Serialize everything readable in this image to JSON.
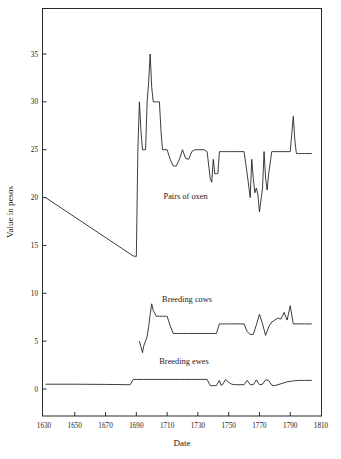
{
  "chart_data": {
    "type": "line",
    "title": "",
    "xlabel": "Date",
    "ylabel": "Value in pesos",
    "xlim": [
      1630,
      1810
    ],
    "ylim": [
      -2.8,
      39
    ],
    "grid": false,
    "legend_position": "inline-annotations",
    "x_ticks": [
      1630,
      1650,
      1670,
      1690,
      1710,
      1730,
      1750,
      1770,
      1790,
      1810
    ],
    "x_tick_labels": [
      "1630",
      "1650",
      "1670",
      "1690",
      "1710",
      "1730",
      "1750",
      "1770",
      "1790",
      "1810"
    ],
    "y_ticks": [
      0,
      5,
      10,
      15,
      20,
      25,
      30,
      35
    ],
    "y_tick_labels": [
      "0",
      "5",
      "10",
      "15",
      "20",
      "25",
      "30",
      "35"
    ],
    "annotations": [
      {
        "text": "Pairs of oxen",
        "x": 1722,
        "y": 19.8
      },
      {
        "text": "Breeding cows",
        "x": 1723,
        "y": 9.1
      },
      {
        "text": "Breeding ewes",
        "x": 1721,
        "y": 2.6
      }
    ],
    "series": [
      {
        "name": "Pairs of oxen",
        "color": "#1a1a1a",
        "points": [
          [
            1631,
            20.0
          ],
          [
            1688,
            13.9
          ],
          [
            1690,
            13.85
          ],
          [
            1691,
            25.0
          ],
          [
            1692,
            30.0
          ],
          [
            1693,
            27.0
          ],
          [
            1694,
            25.0
          ],
          [
            1695,
            25.0
          ],
          [
            1696,
            25.0
          ],
          [
            1697,
            30.0
          ],
          [
            1698,
            32.0
          ],
          [
            1699,
            35.0
          ],
          [
            1700,
            31.5
          ],
          [
            1701,
            30.0
          ],
          [
            1702,
            30.0
          ],
          [
            1703,
            30.0
          ],
          [
            1704,
            30.0
          ],
          [
            1705,
            30.0
          ],
          [
            1706,
            27.0
          ],
          [
            1707,
            25.0
          ],
          [
            1708,
            25.0
          ],
          [
            1710,
            25.0
          ],
          [
            1712,
            24.0
          ],
          [
            1714,
            23.3
          ],
          [
            1716,
            23.3
          ],
          [
            1718,
            24.0
          ],
          [
            1720,
            25.0
          ],
          [
            1722,
            24.1
          ],
          [
            1724,
            24.0
          ],
          [
            1726,
            24.8
          ],
          [
            1728,
            25.0
          ],
          [
            1730,
            25.0
          ],
          [
            1732,
            25.0
          ],
          [
            1734,
            25.0
          ],
          [
            1736,
            24.8
          ],
          [
            1738,
            22.0
          ],
          [
            1739,
            21.6
          ],
          [
            1740,
            24.0
          ],
          [
            1741,
            22.5
          ],
          [
            1742,
            22.5
          ],
          [
            1743,
            22.5
          ],
          [
            1744,
            24.8
          ],
          [
            1745,
            24.8
          ],
          [
            1746,
            24.8
          ],
          [
            1748,
            24.8
          ],
          [
            1750,
            24.8
          ],
          [
            1752,
            24.8
          ],
          [
            1754,
            24.8
          ],
          [
            1756,
            24.8
          ],
          [
            1758,
            24.8
          ],
          [
            1760,
            24.8
          ],
          [
            1762,
            22.5
          ],
          [
            1764,
            20.0
          ],
          [
            1765,
            24.0
          ],
          [
            1766,
            22.0
          ],
          [
            1767,
            20.5
          ],
          [
            1768,
            21.0
          ],
          [
            1769,
            20.3
          ],
          [
            1770,
            18.5
          ],
          [
            1772,
            21.0
          ],
          [
            1773,
            24.8
          ],
          [
            1774,
            22.0
          ],
          [
            1775,
            20.8
          ],
          [
            1776,
            22.5
          ],
          [
            1778,
            24.8
          ],
          [
            1780,
            24.8
          ],
          [
            1782,
            24.8
          ],
          [
            1784,
            24.8
          ],
          [
            1786,
            24.8
          ],
          [
            1788,
            24.8
          ],
          [
            1790,
            24.8
          ],
          [
            1792,
            28.5
          ],
          [
            1793,
            26.0
          ],
          [
            1794,
            24.6
          ],
          [
            1796,
            24.6
          ],
          [
            1798,
            24.6
          ],
          [
            1800,
            24.6
          ],
          [
            1804,
            24.6
          ]
        ]
      },
      {
        "name": "Breeding cows",
        "color": "#1a1a1a",
        "points": [
          [
            1692,
            5.0
          ],
          [
            1694,
            3.8
          ],
          [
            1695,
            4.6
          ],
          [
            1696,
            5.0
          ],
          [
            1697,
            5.5
          ],
          [
            1698,
            6.5
          ],
          [
            1699,
            7.8
          ],
          [
            1700,
            8.9
          ],
          [
            1701,
            8.2
          ],
          [
            1702,
            7.9
          ],
          [
            1703,
            7.6
          ],
          [
            1704,
            7.6
          ],
          [
            1705,
            7.6
          ],
          [
            1707,
            7.6
          ],
          [
            1709,
            7.6
          ],
          [
            1710,
            7.6
          ],
          [
            1712,
            6.6
          ],
          [
            1714,
            5.8
          ],
          [
            1716,
            5.8
          ],
          [
            1718,
            5.8
          ],
          [
            1720,
            5.8
          ],
          [
            1724,
            5.8
          ],
          [
            1728,
            5.8
          ],
          [
            1732,
            5.8
          ],
          [
            1736,
            5.8
          ],
          [
            1740,
            5.8
          ],
          [
            1742,
            5.8
          ],
          [
            1744,
            6.8
          ],
          [
            1746,
            6.8
          ],
          [
            1748,
            6.8
          ],
          [
            1752,
            6.8
          ],
          [
            1756,
            6.8
          ],
          [
            1758,
            6.8
          ],
          [
            1760,
            6.8
          ],
          [
            1762,
            6.0
          ],
          [
            1764,
            5.7
          ],
          [
            1766,
            5.7
          ],
          [
            1768,
            6.7
          ],
          [
            1770,
            7.8
          ],
          [
            1772,
            6.8
          ],
          [
            1774,
            5.6
          ],
          [
            1776,
            6.5
          ],
          [
            1778,
            7.0
          ],
          [
            1780,
            7.2
          ],
          [
            1782,
            7.4
          ],
          [
            1784,
            7.3
          ],
          [
            1786,
            8.0
          ],
          [
            1788,
            7.2
          ],
          [
            1790,
            8.7
          ],
          [
            1792,
            6.8
          ],
          [
            1796,
            6.8
          ],
          [
            1800,
            6.8
          ],
          [
            1804,
            6.8
          ]
        ]
      },
      {
        "name": "Breeding ewes",
        "color": "#1a1a1a",
        "points": [
          [
            1631,
            0.5
          ],
          [
            1650,
            0.5
          ],
          [
            1670,
            0.48
          ],
          [
            1684,
            0.45
          ],
          [
            1686,
            0.45
          ],
          [
            1688,
            1.0
          ],
          [
            1690,
            1.0
          ],
          [
            1694,
            1.0
          ],
          [
            1698,
            1.0
          ],
          [
            1702,
            1.0
          ],
          [
            1706,
            1.0
          ],
          [
            1710,
            1.0
          ],
          [
            1714,
            1.0
          ],
          [
            1718,
            1.0
          ],
          [
            1722,
            1.0
          ],
          [
            1726,
            1.0
          ],
          [
            1730,
            1.0
          ],
          [
            1734,
            1.0
          ],
          [
            1736,
            1.0
          ],
          [
            1738,
            0.35
          ],
          [
            1740,
            0.35
          ],
          [
            1742,
            0.35
          ],
          [
            1744,
            0.9
          ],
          [
            1745,
            0.4
          ],
          [
            1746,
            0.45
          ],
          [
            1748,
            1.0
          ],
          [
            1750,
            0.7
          ],
          [
            1752,
            0.5
          ],
          [
            1754,
            0.45
          ],
          [
            1756,
            0.45
          ],
          [
            1758,
            0.45
          ],
          [
            1760,
            0.45
          ],
          [
            1762,
            0.9
          ],
          [
            1764,
            0.45
          ],
          [
            1766,
            0.45
          ],
          [
            1768,
            0.95
          ],
          [
            1770,
            0.45
          ],
          [
            1772,
            0.5
          ],
          [
            1774,
            0.95
          ],
          [
            1776,
            0.9
          ],
          [
            1778,
            0.4
          ],
          [
            1780,
            0.35
          ],
          [
            1784,
            0.55
          ],
          [
            1788,
            0.75
          ],
          [
            1792,
            0.85
          ],
          [
            1796,
            0.9
          ],
          [
            1800,
            0.9
          ],
          [
            1804,
            0.9
          ]
        ]
      }
    ]
  }
}
